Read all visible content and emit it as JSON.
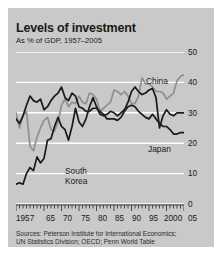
{
  "card": {
    "background": "#c9c9c9"
  },
  "header": {
    "title": "Levels of investment",
    "subtitle": "As % of GDP, 1957–2005"
  },
  "sources": {
    "line1": "Sources: Peterson Institute for International Economics;",
    "line2": "UN Statistics Division; OECD; Penn World Table"
  },
  "axis": {
    "y_ticks": [
      "0",
      "10",
      "20",
      "30",
      "40",
      "50"
    ],
    "x_ticks": [
      "1957",
      "65",
      "70",
      "75",
      "80",
      "85",
      "90",
      "95",
      "2000",
      "05"
    ]
  },
  "labels": {
    "china": "China",
    "japan": "Japan",
    "korea": "South\nKorea",
    "korea_line1": "South",
    "korea_line2": "Korea"
  },
  "chart_data": {
    "type": "line",
    "title": "Levels of investment",
    "subtitle": "As % of GDP, 1957–2005",
    "xlabel": "",
    "ylabel": "As % of GDP",
    "xlim": [
      1957,
      2005
    ],
    "ylim": [
      0,
      50
    ],
    "grid": true,
    "grid_color": "#ffffff",
    "legend": "inline-annotations",
    "x_tick_labels": [
      "1957",
      "65",
      "70",
      "75",
      "80",
      "85",
      "90",
      "95",
      "2000",
      "05"
    ],
    "x_tick_values": [
      1957,
      1965,
      1970,
      1975,
      1980,
      1985,
      1990,
      1995,
      2000,
      2005
    ],
    "y_tick_values": [
      0,
      10,
      20,
      30,
      40,
      50
    ],
    "years": [
      1957,
      1958,
      1959,
      1960,
      1961,
      1962,
      1963,
      1964,
      1965,
      1966,
      1967,
      1968,
      1969,
      1970,
      1971,
      1972,
      1973,
      1974,
      1975,
      1976,
      1977,
      1978,
      1979,
      1980,
      1981,
      1982,
      1983,
      1984,
      1985,
      1986,
      1987,
      1988,
      1989,
      1990,
      1991,
      1992,
      1993,
      1994,
      1995,
      1996,
      1997,
      1998,
      1999,
      2000,
      2001,
      2002,
      2003,
      2004,
      2005
    ],
    "series": [
      {
        "name": "China",
        "color": "#8f8f8f",
        "values": [
          30.0,
          25.0,
          29.0,
          30.5,
          19.0,
          17.5,
          22.0,
          25.0,
          27.5,
          28.5,
          24.5,
          24.0,
          27.0,
          32.5,
          34.5,
          32.0,
          33.5,
          33.0,
          35.5,
          33.5,
          33.0,
          36.5,
          36.0,
          34.5,
          30.5,
          31.5,
          32.5,
          33.5,
          37.5,
          37.0,
          36.0,
          37.0,
          35.5,
          33.0,
          33.0,
          35.5,
          41.5,
          39.5,
          39.5,
          38.5,
          37.0,
          37.0,
          36.5,
          34.5,
          35.5,
          36.5,
          40.5,
          42.0,
          42.5
        ],
        "label_position": {
          "x": 138,
          "y": 68
        }
      },
      {
        "name": "Japan",
        "color": "#1a1a1a",
        "values": [
          28.0,
          26.5,
          29.0,
          32.5,
          35.5,
          34.0,
          33.5,
          34.5,
          31.0,
          32.0,
          34.0,
          35.5,
          36.5,
          38.5,
          35.0,
          34.0,
          36.5,
          35.5,
          32.0,
          31.5,
          30.5,
          30.5,
          31.5,
          31.5,
          30.5,
          29.5,
          28.0,
          28.0,
          28.0,
          27.5,
          28.5,
          30.5,
          32.0,
          32.5,
          32.0,
          30.5,
          29.5,
          28.5,
          28.0,
          29.5,
          28.0,
          26.5,
          25.5,
          25.5,
          24.5,
          23.0,
          23.0,
          23.5,
          23.5
        ],
        "label_position": {
          "x": 140,
          "y": 136
        }
      },
      {
        "name": "South Korea",
        "color": "#1a1a1a",
        "values": [
          6.5,
          7.0,
          6.5,
          10.0,
          12.0,
          11.0,
          15.5,
          13.5,
          15.0,
          21.0,
          21.5,
          25.5,
          28.5,
          25.5,
          24.5,
          21.0,
          25.5,
          31.5,
          27.0,
          25.5,
          28.0,
          32.0,
          35.0,
          32.0,
          29.5,
          29.0,
          29.5,
          30.5,
          30.0,
          29.0,
          30.0,
          31.0,
          33.5,
          37.0,
          38.5,
          37.0,
          36.0,
          36.5,
          37.5,
          38.0,
          35.0,
          25.0,
          29.0,
          31.0,
          29.5,
          29.0,
          30.0,
          30.0,
          30.0
        ],
        "label_position": {
          "x": 57,
          "y": 158
        }
      }
    ]
  }
}
